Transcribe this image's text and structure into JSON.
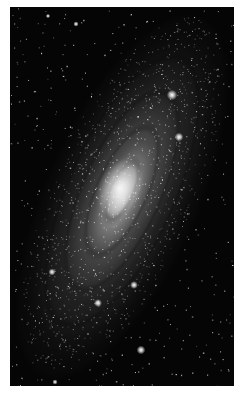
{
  "image": {
    "subject": "spiral-galaxy",
    "description": "Grayscale astronomical photograph of an inclined spiral galaxy on a black star field, framed by a white border",
    "colors": {
      "border": "#ffffff",
      "sky": "#050505",
      "galaxy_glow": "#bebebe",
      "core": "#f0f0f0",
      "stars": "#ffffff"
    },
    "orientation_deg": 24,
    "bright_stars": [
      {
        "x": 172,
        "y": 95,
        "r": 2.4
      },
      {
        "x": 179,
        "y": 137,
        "r": 2.0
      },
      {
        "x": 134,
        "y": 285,
        "r": 1.8
      },
      {
        "x": 98,
        "y": 303,
        "r": 1.8
      },
      {
        "x": 52,
        "y": 272,
        "r": 1.6
      },
      {
        "x": 141,
        "y": 350,
        "r": 2.0
      },
      {
        "x": 76,
        "y": 24,
        "r": 1.2
      },
      {
        "x": 48,
        "y": 16,
        "r": 1.0
      },
      {
        "x": 55,
        "y": 382,
        "r": 1.2
      }
    ]
  }
}
